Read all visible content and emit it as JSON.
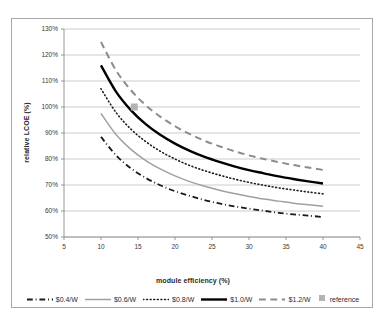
{
  "chart_data": {
    "type": "line",
    "title": "",
    "xlabel": "module efficiency (%)",
    "ylabel": "relative LCOE (%)",
    "xlim": [
      5,
      45
    ],
    "ylim": [
      50,
      130
    ],
    "xticks": [
      5,
      10,
      15,
      20,
      25,
      30,
      35,
      40,
      45
    ],
    "xtick_labels": [
      "5",
      "10",
      "15",
      "20",
      "25",
      "30",
      "35",
      "40",
      "45"
    ],
    "yticks": [
      50,
      60,
      70,
      80,
      90,
      100,
      110,
      120,
      130
    ],
    "ytick_labels": [
      "50%",
      "60%",
      "70%",
      "80%",
      "90%",
      "100%",
      "110%",
      "120%",
      "130%"
    ],
    "grid": "horizontal",
    "legend_position": "bottom",
    "x": [
      10,
      12,
      14,
      16,
      18,
      20,
      22,
      24,
      26,
      28,
      30,
      32,
      34,
      36,
      38,
      40
    ],
    "series": [
      {
        "name": "$0.4/W",
        "color": "#1a1a1a",
        "style": "dashdot",
        "width": 1.8,
        "values": [
          88.5,
          81.5,
          76.5,
          72.8,
          69.9,
          67.6,
          65.8,
          64.2,
          62.9,
          61.8,
          60.9,
          60.1,
          59.3,
          58.7,
          58.2,
          57.7
        ]
      },
      {
        "name": "$0.6/W",
        "color": "#a0a0a0",
        "style": "solid",
        "width": 1.5,
        "values": [
          97.5,
          89.5,
          83.8,
          79.5,
          76.2,
          73.5,
          71.3,
          69.5,
          68.0,
          66.7,
          65.6,
          64.6,
          63.8,
          63.0,
          62.4,
          61.8
        ]
      },
      {
        "name": "$0.8/W",
        "color": "#1a1a1a",
        "style": "dotted",
        "width": 1.6,
        "values": [
          107.0,
          98.0,
          91.6,
          86.8,
          83.0,
          80.0,
          77.5,
          75.5,
          73.8,
          72.3,
          71.0,
          69.9,
          68.9,
          68.1,
          67.3,
          66.6
        ]
      },
      {
        "name": "$1.0/W",
        "color": "#000000",
        "style": "solid",
        "width": 2.4,
        "values": [
          116.0,
          106.0,
          98.9,
          93.5,
          89.3,
          85.9,
          83.1,
          80.8,
          78.9,
          77.2,
          75.7,
          74.5,
          73.3,
          72.3,
          71.4,
          70.6
        ]
      },
      {
        "name": "$1.2/W",
        "color": "#8c8c8c",
        "style": "dashed",
        "width": 2.0,
        "values": [
          125.0,
          114.2,
          106.6,
          100.8,
          96.3,
          92.6,
          89.6,
          87.0,
          84.9,
          83.0,
          81.4,
          80.0,
          78.8,
          77.7,
          76.7,
          75.8
        ]
      }
    ],
    "reference_point": {
      "name": "reference",
      "x": 14.5,
      "y": 100,
      "color": "#b3b3b3"
    },
    "legend": [
      {
        "label": "$0.4/W",
        "style": "dashdot",
        "color": "#1a1a1a",
        "kind": "line"
      },
      {
        "label": "$0.6/W",
        "style": "solid",
        "color": "#a0a0a0",
        "kind": "line"
      },
      {
        "label": "$0.8/W",
        "style": "dotted",
        "color": "#1a1a1a",
        "kind": "line"
      },
      {
        "label": "$1.0/W",
        "style": "solid",
        "color": "#000000",
        "kind": "line"
      },
      {
        "label": "$1.2/W",
        "style": "dashed",
        "color": "#8c8c8c",
        "kind": "line"
      },
      {
        "label": "reference",
        "style": "marker",
        "color": "#b3b3b3",
        "kind": "marker"
      }
    ]
  },
  "colors": {
    "frame_border": "#a6a6a6",
    "gridline": "#bfbfbf",
    "axis_line": "#8c8c8c",
    "text": "#2b2b2b",
    "background": "#ffffff"
  }
}
